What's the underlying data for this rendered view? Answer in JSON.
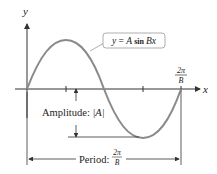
{
  "diagram": {
    "equation_label": "y = A sin Bx",
    "equation_parts": {
      "lhs": "y",
      "eq": " = ",
      "A": "A",
      "sin": " sin ",
      "Bx": "Bx"
    },
    "axis_x_label": "x",
    "axis_y_label": "y",
    "tick_label_end": {
      "numerator": "2π",
      "denominator": "B"
    },
    "amplitude_label": "Amplitude: |A|",
    "amplitude_parts": {
      "text": "Amplitude: ",
      "value": "|A|"
    },
    "period_label": "Period: 2π/B",
    "period_parts": {
      "text": "Period: ",
      "numerator": "2π",
      "denominator": "B"
    },
    "colors": {
      "curve": "#8a8a8a",
      "axes": "#333333",
      "text": "#222222",
      "callout_border": "#999999"
    }
  }
}
